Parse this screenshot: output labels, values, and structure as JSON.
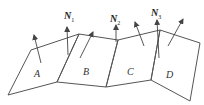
{
  "diagram": {
    "title": "",
    "stroke_color": "#555555",
    "panels": [
      {
        "id": "A",
        "label": "A",
        "points": [
          [
            31,
            50
          ],
          [
            79,
            34
          ],
          [
            57,
            82
          ],
          [
            8,
            95
          ]
        ]
      },
      {
        "id": "B",
        "label": "B",
        "points": [
          [
            79,
            34
          ],
          [
            118,
            40
          ],
          [
            106,
            87
          ],
          [
            57,
            82
          ]
        ]
      },
      {
        "id": "C",
        "label": "C",
        "points": [
          [
            118,
            40
          ],
          [
            160,
            30
          ],
          [
            151,
            80
          ],
          [
            106,
            87
          ]
        ]
      },
      {
        "id": "D",
        "label": "D",
        "points": [
          [
            160,
            30
          ],
          [
            200,
            43
          ],
          [
            190,
            101
          ],
          [
            151,
            80
          ]
        ]
      }
    ],
    "normals": [
      {
        "id": "N1",
        "symbol": "N",
        "sub": "1"
      },
      {
        "id": "N2",
        "symbol": "N",
        "sub": "2"
      },
      {
        "id": "N3",
        "symbol": "N",
        "sub": "3"
      }
    ]
  }
}
